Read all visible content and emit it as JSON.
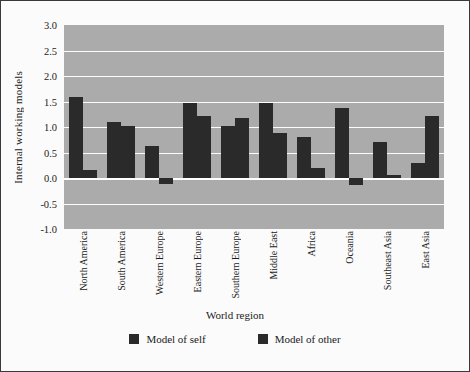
{
  "figure": {
    "background": "#fbfbfb",
    "frame_color": "#3a3a3a",
    "plot_background": "#ababab",
    "gridline_color": "#fdfdfd",
    "bar_color": "#2a2a2a"
  },
  "chart_data": {
    "type": "bar",
    "title": "",
    "xlabel": "World region",
    "ylabel": "Internal working models",
    "ylim": [
      -1.0,
      3.0
    ],
    "yticks": [
      "3.0",
      "2.5",
      "2.0",
      "1.5",
      "1.0",
      "0.5",
      "0.0",
      "-0.5",
      "-1.0"
    ],
    "ytick_values": [
      3.0,
      2.5,
      2.0,
      1.5,
      1.0,
      0.5,
      0.0,
      -0.5,
      -1.0
    ],
    "grid": true,
    "grid_axis": "y",
    "legend_position": "bottom",
    "categories": [
      "North America",
      "South America",
      "Western Europe",
      "Eastern Europe",
      "Southern Europe",
      "Middle East",
      "Africa",
      "Oceania",
      "Southeast Asia",
      "East Asia"
    ],
    "series": [
      {
        "name": "Model of self",
        "color": "#2a2a2a",
        "values": [
          1.58,
          1.1,
          0.63,
          1.48,
          1.02,
          1.47,
          0.8,
          1.37,
          0.7,
          0.3
        ]
      },
      {
        "name": "Model of other",
        "color": "#2a2a2a",
        "values": [
          0.15,
          1.02,
          -0.12,
          1.22,
          1.17,
          0.88,
          0.2,
          -0.13,
          0.05,
          1.22
        ]
      }
    ]
  },
  "legend": {
    "entries": [
      {
        "label": "Model of self"
      },
      {
        "label": "Model of other"
      }
    ]
  }
}
